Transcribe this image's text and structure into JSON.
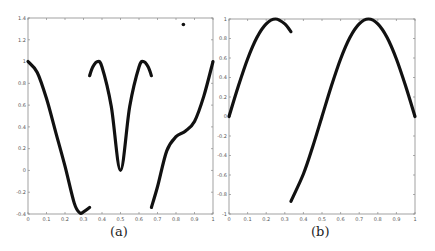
{
  "chart_data": [
    {
      "type": "line",
      "panel_label": "(a)",
      "title": "",
      "xlabel": "",
      "ylabel": "",
      "xlim": [
        0,
        1
      ],
      "ylim": [
        -0.4,
        1.4
      ],
      "xticks": [
        "0",
        "0.1",
        "0.2",
        "0.3",
        "0.4",
        "0.5",
        "0.6",
        "0.7",
        "0.8",
        "0.9",
        "1"
      ],
      "yticks": [
        "-0.4",
        "-0.2",
        "0",
        "0.2",
        "0.4",
        "0.6",
        "0.8",
        "1",
        "1.2",
        "1.4"
      ],
      "grid": false,
      "legend": null,
      "series": [
        {
          "name": "segment-1",
          "x": [
            0,
            0.05,
            0.1,
            0.15,
            0.2,
            0.25,
            0.28,
            0.3,
            0.333
          ],
          "y": [
            1,
            0.9,
            0.66,
            0.35,
            0.04,
            -0.3,
            -0.39,
            -0.38,
            -0.34
          ]
        },
        {
          "name": "segment-2",
          "x": [
            0.333,
            0.35,
            0.375,
            0.4,
            0.45,
            0.5,
            0.55,
            0.6,
            0.625,
            0.65,
            0.667
          ],
          "y": [
            0.87,
            0.95,
            1,
            0.95,
            0.59,
            0,
            0.59,
            0.95,
            1,
            0.95,
            0.87
          ]
        },
        {
          "name": "segment-3",
          "x": [
            0.667,
            0.7,
            0.75,
            0.8,
            0.85,
            0.9,
            0.95,
            1
          ],
          "y": [
            -0.34,
            -0.15,
            0.18,
            0.31,
            0.36,
            0.45,
            0.68,
            1
          ]
        }
      ],
      "annotations": [
        {
          "type": "point",
          "x": 0.84,
          "y": 1.34
        }
      ]
    },
    {
      "type": "line",
      "panel_label": "(b)",
      "title": "",
      "xlabel": "",
      "ylabel": "",
      "xlim": [
        0,
        1
      ],
      "ylim": [
        -1,
        1
      ],
      "xticks": [
        "0",
        "0.1",
        "0.2",
        "0.3",
        "0.4",
        "0.5",
        "0.6",
        "0.7",
        "0.8",
        "0.9",
        "1"
      ],
      "yticks": [
        "-1",
        "-0.8",
        "-0.6",
        "-0.4",
        "-0.2",
        "0",
        "0.2",
        "0.4",
        "0.6",
        "0.8",
        "1"
      ],
      "grid": false,
      "legend": null,
      "series": [
        {
          "name": "segment-1",
          "x": [
            0,
            0.05,
            0.1,
            0.15,
            0.2,
            0.25,
            0.3,
            0.333
          ],
          "y": [
            0,
            0.31,
            0.59,
            0.81,
            0.95,
            1,
            0.95,
            0.87
          ]
        },
        {
          "name": "segment-2",
          "x": [
            0.333,
            0.4,
            0.45,
            0.5,
            0.55,
            0.6,
            0.65,
            0.7,
            0.75,
            0.8,
            0.85,
            0.9,
            0.95,
            1
          ],
          "y": [
            -0.87,
            -0.59,
            -0.31,
            0,
            0.31,
            0.59,
            0.81,
            0.95,
            1,
            0.95,
            0.81,
            0.59,
            0.31,
            0
          ]
        }
      ],
      "annotations": []
    }
  ],
  "captions": {
    "a": "(a)",
    "b": "(b)"
  }
}
